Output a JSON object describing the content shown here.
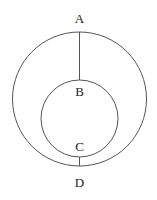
{
  "diagram": {
    "stroke_color": "#555555",
    "outer_circle": {
      "cx": 79.5,
      "cy": 99,
      "r": 67
    },
    "inner_circle": {
      "cx": 79.5,
      "cy": 118.5,
      "r": 38.5
    },
    "segments": [
      {
        "from": "A",
        "to": "B",
        "x1": 79.5,
        "y1": 32,
        "x2": 79.5,
        "y2": 80
      },
      {
        "from": "C",
        "to": "D",
        "x1": 79.5,
        "y1": 157,
        "x2": 79.5,
        "y2": 166
      }
    ],
    "labels": {
      "A": "A",
      "B": "B",
      "C": "C",
      "D": "D"
    }
  }
}
